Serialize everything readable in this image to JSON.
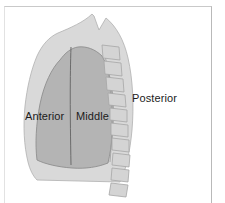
{
  "figure": {
    "labels": {
      "anterior": "Anterior",
      "middle": "Middle",
      "posterior": "Posterior"
    },
    "colors": {
      "background": "#ffffff",
      "frame_line": "#c9c9c9",
      "outer_lung_fill": "#d9d9d9",
      "inner_lung_fill": "#b4b4b4",
      "outline_stroke": "#9a9a9a",
      "divider_stroke": "#6e6e6e",
      "vertebra_fill": "#d4d4d4",
      "vertebra_stroke": "#a8a8a8",
      "label_text": "#1b1b1b"
    },
    "regions": [
      {
        "name": "anterior",
        "label": "Anterior",
        "shade": "mid-gray"
      },
      {
        "name": "middle",
        "label": "Middle",
        "shade": "mid-gray"
      },
      {
        "name": "posterior",
        "label": "Posterior",
        "shade": "light-gray"
      }
    ],
    "vertebral_column": {
      "segment_count": 10,
      "orientation": "curved-vertical-right"
    }
  }
}
